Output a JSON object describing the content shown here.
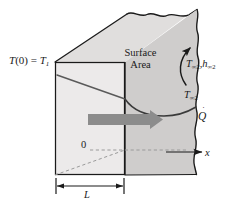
{
  "figure": {
    "type": "engineering-schematic"
  },
  "labels": {
    "left_surface_temperature": {
      "prefix": "T",
      "argument": "(0)",
      "equals": " = ",
      "symbol": "T",
      "subscript": "1",
      "full_text": "T(0) = T1"
    },
    "surface_area": {
      "line1": "Surface",
      "line2": "Area",
      "full_text": "Surface Area"
    },
    "convection_pair": {
      "symbol1": "T",
      "subscript1": "∞2",
      "separator": ",",
      "symbol2": "h",
      "subscript2": "∞2",
      "full_text": "T∞2 , h∞2"
    },
    "fluid_temperature": {
      "symbol": "T",
      "subscript": "∞2",
      "full_text": "T∞2"
    },
    "heat_rate": {
      "symbol": "Q",
      "accent": "˙",
      "full_text": "Q̇"
    },
    "origin": {
      "text": "0"
    },
    "x_axis": {
      "text": "x"
    },
    "thickness": {
      "text": "L"
    }
  },
  "colors": {
    "outline": "#1a1a1a",
    "slab_front_face": "#eceaea",
    "slab_top_face": "#e0dedd",
    "slab_right_face": "#cfcdcc",
    "flow_arrow": "#8c8c8c",
    "dashed_line": "#9a9a9a",
    "profile_line": "#5a5a5a",
    "background": "#ffffff",
    "text": "#1a1a1a"
  },
  "geometry": {
    "front_face_left_x": 55,
    "front_face_right_x": 125,
    "front_face_top_y": 62,
    "front_face_bottom_y": 175,
    "depth_offset_x": 72,
    "depth_offset_y": -48,
    "dimension_line_y": 186,
    "x_axis_y": 156,
    "x_axis_end_x": 202
  },
  "annotations": {
    "flow_arrow_direction": "right",
    "convection_arrow_direction": "counterclockwise-up",
    "temperature_profile": "linear-decreasing-then-convective-curve"
  }
}
